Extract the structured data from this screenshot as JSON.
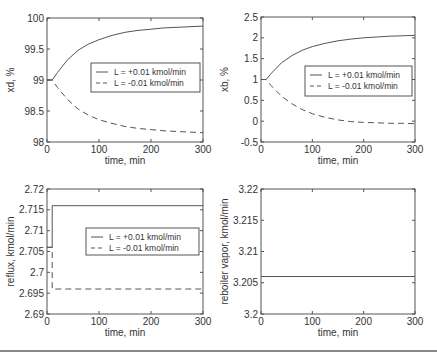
{
  "chart_data": [
    {
      "id": "xd",
      "type": "line",
      "title": "",
      "xlabel": "time, min",
      "ylabel": "xd, %",
      "xlim": [
        0,
        300
      ],
      "ylim": [
        98,
        100
      ],
      "xticks": [
        0,
        100,
        200,
        300
      ],
      "xtick_labels": [
        "0",
        "100",
        "200",
        "300"
      ],
      "yticks": [
        98,
        98.5,
        99,
        99.5,
        100
      ],
      "ytick_labels": [
        "98",
        "98.5",
        "99",
        "99.5",
        "100"
      ],
      "grid": false,
      "legend": {
        "position": "center-right",
        "entries": [
          "L = +0.01 kmol/min",
          "L = -0.01 kmol/min"
        ]
      },
      "series": [
        {
          "name": "L = +0.01 kmol/min",
          "style": "solid",
          "x": [
            0,
            10,
            20,
            40,
            60,
            80,
            100,
            125,
            150,
            175,
            200,
            225,
            250,
            275,
            300
          ],
          "y": [
            99.0,
            99.0,
            99.12,
            99.33,
            99.48,
            99.58,
            99.65,
            99.72,
            99.77,
            99.8,
            99.82,
            99.84,
            99.85,
            99.86,
            99.87
          ]
        },
        {
          "name": "L = -0.01 kmol/min",
          "style": "dashed",
          "x": [
            0,
            10,
            20,
            40,
            60,
            80,
            100,
            125,
            150,
            175,
            200,
            225,
            250,
            275,
            300
          ],
          "y": [
            99.0,
            99.0,
            98.88,
            98.68,
            98.53,
            98.43,
            98.36,
            98.3,
            98.25,
            98.22,
            98.2,
            98.18,
            98.17,
            98.16,
            98.15
          ]
        }
      ]
    },
    {
      "id": "xb",
      "type": "line",
      "title": "",
      "xlabel": "time, min",
      "ylabel": "xb, %",
      "xlim": [
        0,
        300
      ],
      "ylim": [
        -0.5,
        2.5
      ],
      "xticks": [
        0,
        100,
        200,
        300
      ],
      "xtick_labels": [
        "0",
        "100",
        "200",
        "300"
      ],
      "yticks": [
        -0.5,
        0,
        0.5,
        1,
        1.5,
        2,
        2.5
      ],
      "ytick_labels": [
        "-0.5",
        "0",
        "0.5",
        "1",
        "1.5",
        "2",
        "2.5"
      ],
      "grid": false,
      "legend": {
        "position": "center-right",
        "entries": [
          "L = +0.01 kmol/min",
          "L = -0.01 kmol/min"
        ]
      },
      "series": [
        {
          "name": "L = +0.01 kmol/min",
          "style": "solid",
          "x": [
            0,
            10,
            20,
            40,
            60,
            80,
            100,
            125,
            150,
            175,
            200,
            225,
            250,
            275,
            300
          ],
          "y": [
            1.0,
            1.0,
            1.15,
            1.4,
            1.57,
            1.7,
            1.79,
            1.87,
            1.93,
            1.97,
            2.0,
            2.02,
            2.04,
            2.05,
            2.06
          ]
        },
        {
          "name": "L = -0.01 kmol/min",
          "style": "dashed",
          "x": [
            0,
            10,
            20,
            40,
            60,
            80,
            100,
            125,
            150,
            175,
            200,
            225,
            250,
            275,
            300
          ],
          "y": [
            1.0,
            1.0,
            0.85,
            0.6,
            0.42,
            0.28,
            0.18,
            0.09,
            0.03,
            -0.01,
            -0.03,
            -0.04,
            -0.05,
            -0.05,
            -0.06
          ]
        }
      ]
    },
    {
      "id": "reflux",
      "type": "line",
      "title": "",
      "xlabel": "time, min",
      "ylabel": "reflux, kmol/min",
      "xlim": [
        0,
        300
      ],
      "ylim": [
        2.69,
        2.72
      ],
      "xticks": [
        0,
        100,
        200,
        300
      ],
      "xtick_labels": [
        "0",
        "100",
        "200",
        "300"
      ],
      "yticks": [
        2.69,
        2.695,
        2.7,
        2.705,
        2.71,
        2.715,
        2.72
      ],
      "ytick_labels": [
        "2.69",
        "2.695",
        "2.7",
        "2.705",
        "2.71",
        "2.715",
        "2.72"
      ],
      "grid": false,
      "legend": {
        "position": "center-right",
        "entries": [
          "L = +0.01 kmol/min",
          "L = -0.01 kmol/min"
        ]
      },
      "series": [
        {
          "name": "L = +0.01 kmol/min",
          "style": "solid",
          "x": [
            0,
            10,
            10,
            300
          ],
          "y": [
            2.706,
            2.706,
            2.716,
            2.716
          ]
        },
        {
          "name": "L = -0.01 kmol/min",
          "style": "dashed",
          "x": [
            0,
            10,
            10,
            300
          ],
          "y": [
            2.706,
            2.706,
            2.696,
            2.696
          ]
        }
      ]
    },
    {
      "id": "reboiler",
      "type": "line",
      "title": "",
      "xlabel": "time, min",
      "ylabel": "reboiler vapor, kmol/min",
      "xlim": [
        0,
        300
      ],
      "ylim": [
        3.2,
        3.22
      ],
      "xticks": [
        0,
        100,
        200,
        300
      ],
      "xtick_labels": [
        "0",
        "100",
        "200",
        "300"
      ],
      "yticks": [
        3.2,
        3.205,
        3.21,
        3.215,
        3.22
      ],
      "ytick_labels": [
        "3.2",
        "3.205",
        "3.21",
        "3.215",
        "3.22"
      ],
      "grid": false,
      "legend": null,
      "series": [
        {
          "name": "vapor boilup",
          "style": "solid",
          "x": [
            0,
            300
          ],
          "y": [
            3.206,
            3.206
          ]
        }
      ]
    }
  ],
  "layout": {
    "panels": [
      {
        "left": 47,
        "top": 18,
        "right": 203,
        "bottom": 142,
        "legend_box": [
          91,
          63,
          200,
          92
        ]
      },
      {
        "left": 261,
        "top": 17,
        "right": 415,
        "bottom": 142,
        "legend_box": [
          305,
          66,
          412,
          96
        ]
      },
      {
        "left": 47,
        "top": 189,
        "right": 203,
        "bottom": 314,
        "legend_box": [
          86,
          228,
          199,
          255
        ]
      },
      {
        "left": 261,
        "top": 189,
        "right": 415,
        "bottom": 314,
        "legend_box": null
      }
    ],
    "line_color": "#555555",
    "text_color": "#333333"
  }
}
